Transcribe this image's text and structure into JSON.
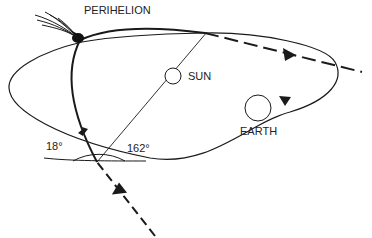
{
  "diagram": {
    "labels": {
      "perihelion": "PERIHELION",
      "sun": "SUN",
      "earth": "EARTH",
      "angle_small": "18°",
      "angle_large": "162°"
    },
    "colors": {
      "line": "#1a1a1a",
      "background": "#ffffff"
    },
    "elements": [
      "comet-head-with-tail",
      "comet-path-incoming-dashed",
      "comet-path-solid-around-perihelion",
      "comet-path-outgoing-dashed",
      "earth-orbit-ellipse",
      "sun-circle",
      "earth-circle",
      "direction-arrows",
      "angle-arc"
    ]
  }
}
